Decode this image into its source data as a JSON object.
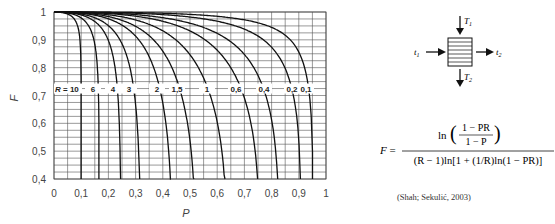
{
  "chart_data": {
    "type": "line",
    "title": "",
    "xlabel": "P",
    "ylabel": "F",
    "xlim": [
      0,
      1
    ],
    "ylim": [
      0.4,
      1
    ],
    "grid": true,
    "x_grid_step": 0.05,
    "y_grid_step": 0.025,
    "x_ticks": [
      "0",
      "0,1",
      "0,2",
      "0,3",
      "0,4",
      "0,5",
      "0,6",
      "0,7",
      "0,8",
      "0,9",
      "1"
    ],
    "y_ticks": [
      "0,4",
      "0,5",
      "0,6",
      "0,7",
      "0,8",
      "0,9",
      "1"
    ],
    "series_labels_row": "R = 10 | 6 | 4 | 3 | 2 | 1,5 | 1 | 0,6 | 0,4 | 0,2 | 0,1",
    "series": [
      {
        "name": "R = 10",
        "R": 10,
        "label": "R = 10",
        "p_end": 0.1
      },
      {
        "name": "R = 6",
        "R": 6,
        "label": "6",
        "p_end": 0.165
      },
      {
        "name": "R = 4",
        "R": 4,
        "label": "4",
        "p_end": 0.25
      },
      {
        "name": "R = 3",
        "R": 3,
        "label": "3",
        "p_end": 0.315
      },
      {
        "name": "R = 2",
        "R": 2,
        "label": "2",
        "p_end": 0.43
      },
      {
        "name": "R = 1,5",
        "R": 1.5,
        "label": "1,5",
        "p_end": 0.52
      },
      {
        "name": "R = 1",
        "R": 1,
        "label": "1",
        "p_end": 0.635
      },
      {
        "name": "R = 0,6",
        "R": 0.6,
        "label": "0,6",
        "p_end": 0.76
      },
      {
        "name": "R = 0,4",
        "R": 0.4,
        "label": "0,4",
        "p_end": 0.835
      },
      {
        "name": "R = 0,2",
        "R": 0.2,
        "label": "0,2",
        "p_end": 0.915
      },
      {
        "name": "R = 0,1",
        "R": 0.1,
        "label": "0,1",
        "p_end": 0.955
      }
    ]
  },
  "diagram": {
    "T1": "T",
    "T1_sub": "1",
    "T2": "T",
    "T2_sub": "2",
    "t1": "t",
    "t1_sub": "1",
    "t2": "t",
    "t2_sub": "2"
  },
  "formula": {
    "lhs": "F =",
    "numerator": "ln((1 − PR)/(1 − P))",
    "num_top": "1 − PR",
    "num_bottom": "1 − P",
    "denominator": "(R − 1)ln[1 + (1/R)ln(1 − PR)]"
  },
  "citation": "(Shah; Sekulić, 2003)"
}
